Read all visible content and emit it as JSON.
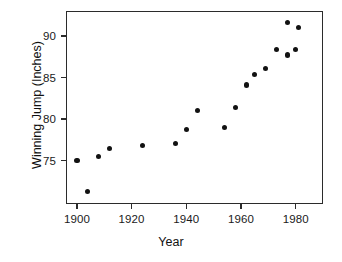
{
  "chart_data": {
    "type": "scatter",
    "title": "",
    "xlabel": "Year",
    "ylabel": "Winning Jump (Inches)",
    "xlim": [
      1896,
      1990
    ],
    "ylim": [
      69.8,
      93.0
    ],
    "xticks": [
      1900,
      1920,
      1940,
      1960,
      1980
    ],
    "xticklabels": [
      "1900",
      "1920",
      "1940",
      "1960",
      "1980"
    ],
    "yticks": [
      75,
      80,
      85,
      90
    ],
    "yticklabels": [
      "75",
      "80",
      "85",
      "90"
    ],
    "grid": false,
    "legend": null,
    "marker": "filled-circle",
    "marker_color": "#121212",
    "frame_color": "#2b2b2b",
    "background": "#ffffff",
    "x": [
      1900,
      1904,
      1908,
      1912,
      1924,
      1936,
      1940,
      1944,
      1954,
      1958,
      1962,
      1965,
      1969,
      1973,
      1977,
      1977,
      1980,
      1981
    ],
    "y": [
      75.0,
      71.3,
      75.5,
      76.5,
      76.8,
      77.1,
      78.8,
      81.0,
      79.0,
      81.4,
      84.1,
      85.4,
      86.1,
      88.4,
      91.6,
      87.7,
      88.4,
      91.0
    ],
    "points": [
      {
        "x": 1900,
        "y": 75.0
      },
      {
        "x": 1904,
        "y": 71.3
      },
      {
        "x": 1908,
        "y": 75.5
      },
      {
        "x": 1912,
        "y": 76.5
      },
      {
        "x": 1924,
        "y": 76.8
      },
      {
        "x": 1936,
        "y": 77.1
      },
      {
        "x": 1940,
        "y": 78.8
      },
      {
        "x": 1944,
        "y": 81.0
      },
      {
        "x": 1954,
        "y": 79.0
      },
      {
        "x": 1958,
        "y": 81.4
      },
      {
        "x": 1962,
        "y": 84.1
      },
      {
        "x": 1965,
        "y": 85.4
      },
      {
        "x": 1969,
        "y": 86.1
      },
      {
        "x": 1973,
        "y": 88.4
      },
      {
        "x": 1977,
        "y": 91.6
      },
      {
        "x": 1977,
        "y": 87.7
      },
      {
        "x": 1980,
        "y": 88.4
      },
      {
        "x": 1981,
        "y": 91.0
      }
    ]
  }
}
